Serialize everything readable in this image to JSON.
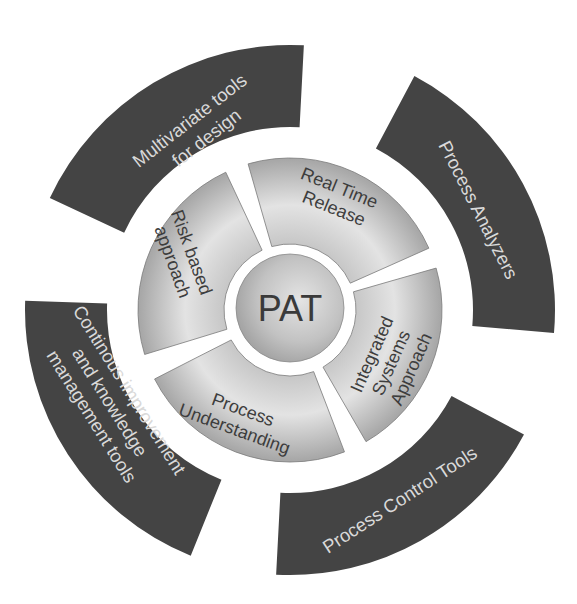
{
  "diagram": {
    "title": "PAT",
    "center": {
      "label": "PAT"
    },
    "inner_ring": [
      {
        "id": "real-time-release",
        "lines": [
          "Real Time",
          "Release"
        ]
      },
      {
        "id": "integrated-systems-approach",
        "lines": [
          "Integrated",
          "Systems",
          "Approach"
        ]
      },
      {
        "id": "process-understanding",
        "lines": [
          "Process",
          "Understanding"
        ]
      },
      {
        "id": "risk-based-approach",
        "lines": [
          "Risk based",
          "approach"
        ]
      }
    ],
    "outer_ring": [
      {
        "id": "multivariate-tools",
        "lines": [
          "Multivariate tools",
          "for design"
        ]
      },
      {
        "id": "process-analyzers",
        "lines": [
          "Process Analyzers"
        ]
      },
      {
        "id": "process-control-tools",
        "lines": [
          "Process Control Tools"
        ]
      },
      {
        "id": "continuous-improvement",
        "lines": [
          "Continous improvement",
          "and knowledge",
          "management tools"
        ]
      }
    ],
    "colors": {
      "outer_fill": "#444444",
      "outer_text": "#d9d9d9",
      "inner_fill_light": "#e6e6e6",
      "inner_fill_dark": "#a9a9a9",
      "inner_text": "#3d3d3d",
      "background": "#ffffff"
    }
  }
}
